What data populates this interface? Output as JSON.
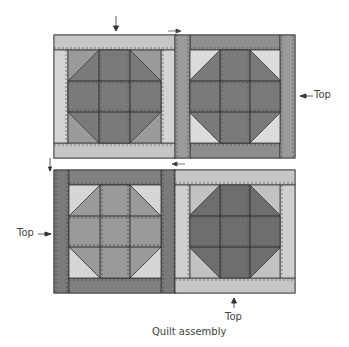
{
  "caption": "Quilt assembly",
  "labels": {
    "top_right": "Top",
    "left_middle": "Top",
    "bottom": "Top"
  },
  "colors": {
    "dark": "#7a7a7a",
    "medium": "#9a9a9a",
    "light": "#c6c6c6",
    "lightest": "#dcdcdc",
    "outline": "#333333",
    "stitch": "#555555"
  },
  "blocks": [
    {
      "name": "top-left-block",
      "sash": "light",
      "corners": "medium",
      "center": "dark"
    },
    {
      "name": "top-right-block",
      "sash": "medium",
      "corners": "lightest",
      "center": "dark"
    },
    {
      "name": "bottom-left-block",
      "sash": "dark",
      "corners": "lightest",
      "center": "medium"
    },
    {
      "name": "bottom-right-block",
      "sash": "light",
      "corners": "light",
      "center": "dark"
    }
  ]
}
